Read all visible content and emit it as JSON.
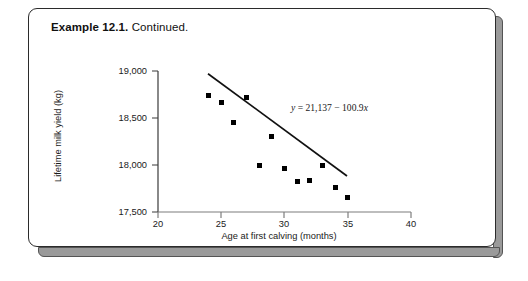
{
  "caption": {
    "bold": "Example 12.1.",
    "rest": " Continued."
  },
  "chart_data": {
    "type": "scatter",
    "title": "",
    "xlabel": "Age at first calving (months)",
    "ylabel": "Lifetime milk yield (kg)",
    "xlim": [
      20,
      40
    ],
    "ylim": [
      17500,
      19000
    ],
    "xticks": [
      "20",
      "25",
      "30",
      "35",
      "40"
    ],
    "xtick_values": [
      20,
      25,
      30,
      35,
      40
    ],
    "yticks": [
      "17,500",
      "18,000",
      "18,500",
      "19,000"
    ],
    "ytick_values": [
      17500,
      18000,
      18500,
      19000
    ],
    "grid": false,
    "legend": false,
    "marker": "filled-square",
    "marker_color": "#000000",
    "x": [
      24,
      25,
      26,
      27,
      28,
      29,
      30,
      31,
      32,
      33,
      34,
      35
    ],
    "y": [
      18740,
      18670,
      18450,
      18720,
      18000,
      18300,
      17960,
      17820,
      17840,
      17990,
      17760,
      17650
    ],
    "points": [
      {
        "x": 24,
        "y": 18740
      },
      {
        "x": 25,
        "y": 18670
      },
      {
        "x": 26,
        "y": 18450
      },
      {
        "x": 27,
        "y": 18720
      },
      {
        "x": 28,
        "y": 18000
      },
      {
        "x": 29,
        "y": 18300
      },
      {
        "x": 30,
        "y": 17960
      },
      {
        "x": 31,
        "y": 17820
      },
      {
        "x": 32,
        "y": 17840
      },
      {
        "x": 33,
        "y": 17990
      },
      {
        "x": 34,
        "y": 17760
      },
      {
        "x": 35,
        "y": 17650
      }
    ],
    "trendline": {
      "equation_text": "y = 21,137 − 100.9x",
      "equation_y_label": "y",
      "equation_body": " = 21,137 − 100.9",
      "equation_x_label": "x",
      "intercept": 21137,
      "slope": -100.9,
      "x_start": 24,
      "x_end": 35,
      "y_start": 18715.4,
      "y_end": 17605.5,
      "color": "#000000"
    },
    "annotations": [
      {
        "text": "y = 21,137 − 100.9x",
        "x": 31.2,
        "y": 18620
      }
    ]
  }
}
